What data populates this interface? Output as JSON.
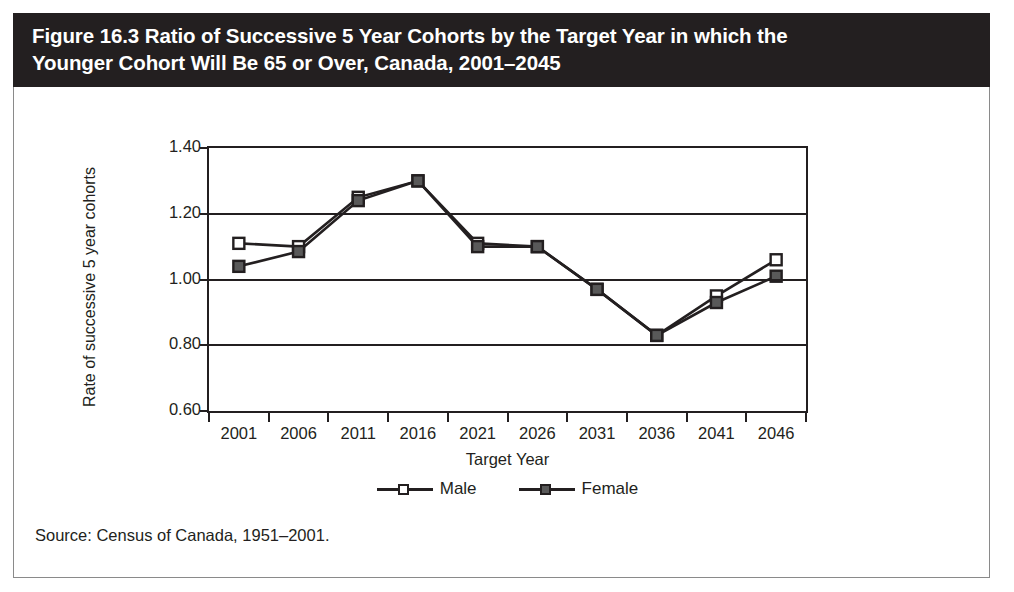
{
  "figure": {
    "title": "Figure 16.3 Ratio of Successive 5 Year Cohorts by the Target Year in which the\nYounger Cohort Will Be 65 or Over, Canada, 2001–2045",
    "source_note": "Source: Census of Canada, 1951–2001."
  },
  "chart_data": {
    "type": "line",
    "title": "Figure 16.3 Ratio of Successive 5 Year Cohorts by the Target Year in which the Younger Cohort Will Be 65 or Over, Canada, 2001–2045",
    "xlabel": "Target Year",
    "ylabel": "Rate of successive 5 year cohorts",
    "categories": [
      "2001",
      "2006",
      "2011",
      "2016",
      "2021",
      "2026",
      "2031",
      "2036",
      "2041",
      "2046"
    ],
    "ylim": [
      0.6,
      1.4
    ],
    "yticks": [
      "0.60",
      "0.80",
      "1.00",
      "1.20",
      "1.40"
    ],
    "ytick_values": [
      0.6,
      0.8,
      1.0,
      1.2,
      1.4
    ],
    "grid": "horizontal",
    "legend_position": "bottom-center",
    "series": [
      {
        "name": "Male",
        "marker": "open-square",
        "color": "#231f20",
        "values": [
          1.11,
          1.1,
          1.25,
          1.3,
          1.11,
          1.1,
          0.97,
          0.83,
          0.95,
          1.06
        ]
      },
      {
        "name": "Female",
        "marker": "filled-square",
        "color": "#231f20",
        "marker_fill": "#595959",
        "values": [
          1.04,
          1.085,
          1.24,
          1.3,
          1.1,
          1.1,
          0.97,
          0.83,
          0.93,
          1.01
        ]
      }
    ]
  }
}
